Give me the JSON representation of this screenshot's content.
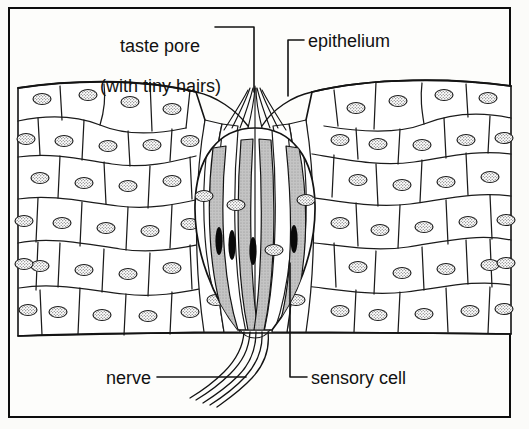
{
  "diagram": {
    "type": "biological-line-drawing",
    "background_color": "#fbfbf9",
    "ink_color": "#111111",
    "frame": {
      "border_color": "#0d0d0d",
      "border_width_px": 2
    },
    "labels": [
      {
        "id": "taste-pore",
        "line1": "taste pore",
        "line2": "(with tiny hairs)",
        "leader": "elbow-right-then-down",
        "points_to": "taste pore at apex of taste bud"
      },
      {
        "id": "epithelium",
        "text": "epithelium",
        "leader": "elbow-left-then-down",
        "points_to": "stratified squamous epithelial cell sheet"
      },
      {
        "id": "nerve",
        "text": "nerve",
        "leader": "horizontal-right",
        "points_to": "nerve fibres leaving base of taste bud"
      },
      {
        "id": "sensory-cell",
        "text": "sensory cell",
        "leader": "elbow-left-then-up",
        "points_to": "shaded gustatory sensory cell inside taste bud"
      }
    ],
    "structures": {
      "epithelium": {
        "name": "epithelium",
        "cell_count_approx": 88,
        "cell_shape": "polygonal / squamous",
        "nucleus_style": "stippled oval",
        "fill": "#ffffff"
      },
      "taste_bud": {
        "name": "taste bud",
        "outline": "onion / barrel shaped",
        "sensory_cells": 4,
        "sensory_cell_fill": "#bdbdbd",
        "sensory_cell_nucleus_fill": "#0a0a0a",
        "supporting_cells": 6,
        "taste_pore_hairs": 9
      },
      "nerve": {
        "name": "nerve",
        "fibre_count": 5,
        "style": "wavy descending fibres"
      }
    }
  }
}
